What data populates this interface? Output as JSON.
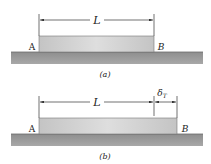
{
  "figure_a": {
    "caption": "(a)",
    "left_label": "A",
    "right_label": "B",
    "length_label": "L"
  },
  "figure_b": {
    "caption": "(b)",
    "left_label": "A",
    "right_label": "B",
    "length_label": "L",
    "elongation_label": "δ",
    "elongation_subscript": "T"
  },
  "colors": {
    "ground": "#9a9a9a",
    "bar": "#cfcfcf",
    "line": "#333333"
  }
}
